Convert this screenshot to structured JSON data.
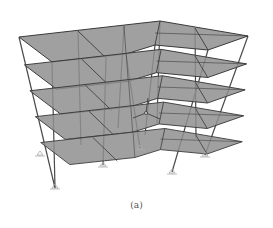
{
  "figure": {
    "caption": "(a)",
    "floors": 5,
    "colors": {
      "slab": "#8f8f8f",
      "slab_edge": "#3a3a3a",
      "column": "#4a4a4a",
      "support": "#bdbdbd",
      "background": "#ffffff"
    },
    "icons": [
      "coordinate-axes-icon",
      "pin-support-icon"
    ]
  }
}
